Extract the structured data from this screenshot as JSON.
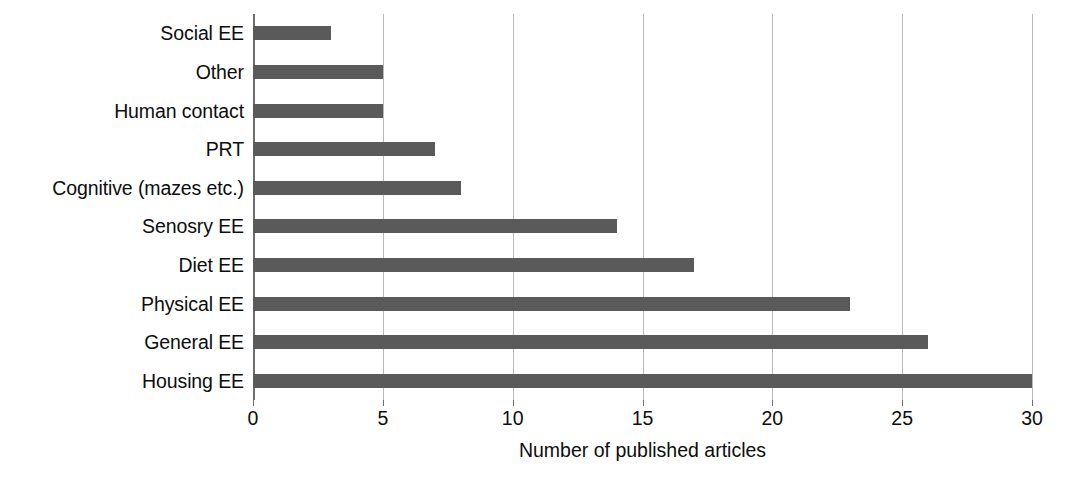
{
  "chart_data": {
    "type": "bar",
    "orientation": "horizontal",
    "title": "",
    "xlabel": "Number of published articles",
    "ylabel": "",
    "categories": [
      "Social EE",
      "Other",
      "Human contact",
      "PRT",
      "Cognitive (mazes etc.)",
      "Senosry EE",
      "Diet EE",
      "Physical EE",
      "General EE",
      "Housing EE"
    ],
    "values": [
      3,
      5,
      5,
      7,
      8,
      14,
      17,
      23,
      26,
      30
    ],
    "xlim": [
      0,
      30
    ],
    "xticks": [
      0,
      5,
      10,
      15,
      20,
      25,
      30
    ],
    "xtick_labels": [
      "0",
      "5",
      "10",
      "15",
      "20",
      "25",
      "30"
    ],
    "grid": true,
    "grid_axis": "x",
    "legend": false,
    "legend_position": "none",
    "bar_color": "#5a5a5a",
    "grid_color": "#b9b9b9",
    "axis_color": "#6e6e6e",
    "background_color": "#ffffff",
    "text_color": "#0d0d0d"
  }
}
